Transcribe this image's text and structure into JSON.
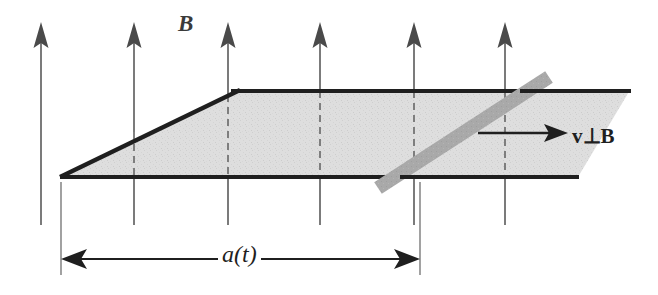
{
  "figure": {
    "background_color": "#ffffff",
    "width": 658,
    "height": 295,
    "labels": {
      "magnetic_field": "B",
      "velocity_perpendicular": "v⊥B",
      "dimension": "a(t)"
    },
    "colors": {
      "line": "#1f1f1f",
      "arrow_fill": "#4a4a4a",
      "shaded_area": "#dcdcdc",
      "rod_gray": "#a8a8a8",
      "dashed": "#6e6e6e"
    },
    "field_arrows": {
      "count": 6,
      "direction": "up",
      "x_positions": [
        41,
        134,
        228,
        320,
        414,
        505
      ],
      "tip_y": 22,
      "tail_y": 225,
      "head_width": 15,
      "head_height": 26,
      "dashed_inside_region": true
    },
    "shaded_region": {
      "shape": "trapezoid",
      "vertices": [
        [
          61,
          177
        ],
        [
          240,
          91
        ],
        [
          630,
          91
        ],
        [
          578,
          177
        ]
      ],
      "description": "Swept area of the circuit loop"
    },
    "rails": {
      "top_rail": {
        "x1": 232,
        "y1": 91,
        "x2": 631,
        "y2": 91
      },
      "bottom_rail": {
        "x1": 60,
        "y1": 177,
        "x2": 579,
        "y2": 177
      },
      "diagonal_rail": {
        "x1": 61,
        "y1": 177,
        "x2": 240,
        "y2": 90
      }
    },
    "rod": {
      "label": "sliding conducting rod",
      "x1": 378,
      "y1": 188,
      "x2": 549,
      "y2": 77,
      "thickness": 13,
      "color": "#a8a8a8"
    },
    "velocity_arrow": {
      "x1": 478,
      "y1": 133,
      "x2": 566,
      "y2": 133,
      "direction": "right"
    },
    "dimension_arrow": {
      "x1": 61,
      "x2": 420,
      "y": 259,
      "double_headed": true,
      "extension_lines": [
        {
          "x": 61,
          "y1": 180,
          "y2": 272
        },
        {
          "x": 420,
          "y1": 180,
          "y2": 272
        }
      ]
    }
  }
}
